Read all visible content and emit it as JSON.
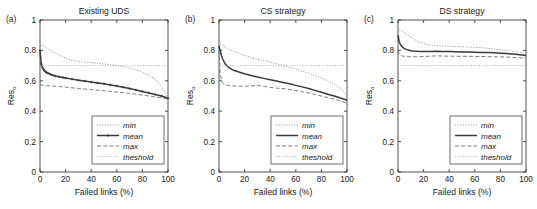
{
  "figure": {
    "xlabel": "Failed links (%)",
    "ylabel_main": "Res",
    "ylabel_sub": "o",
    "xticks": [
      "0",
      "20",
      "40",
      "60",
      "80",
      "100"
    ],
    "yticks": [
      "0",
      "0.2",
      "0.4",
      "0.6",
      "0.8",
      "1"
    ],
    "xlim": [
      0,
      100
    ],
    "ylim": [
      0,
      1
    ],
    "legend_items": [
      "min",
      "mean",
      "max",
      "theshold"
    ],
    "colors": {
      "min": "#8c8c8c",
      "mean": "#3a3a3a",
      "max": "#6e6e6e",
      "threshold": "#a8a8a8",
      "axis": "#3c3c3c",
      "background": "#ffffff"
    }
  },
  "panels": [
    {
      "letter": "(a)",
      "title": "Existing UDS"
    },
    {
      "letter": "(b)",
      "title": "CS strategy"
    },
    {
      "letter": "(c)",
      "title": "DS strategy"
    }
  ],
  "chart_data": [
    {
      "type": "line",
      "title": "Existing UDS",
      "panel": "(a)",
      "xlabel": "Failed links (%)",
      "ylabel": "Res_o",
      "xlim": [
        0,
        100
      ],
      "ylim": [
        0,
        1
      ],
      "grid": false,
      "legend_position": "lower right",
      "x": [
        0,
        1,
        2,
        3,
        4,
        5,
        6,
        8,
        10,
        12,
        15,
        18,
        20,
        25,
        30,
        35,
        40,
        45,
        50,
        55,
        60,
        65,
        70,
        75,
        80,
        85,
        90,
        95,
        100
      ],
      "series": [
        {
          "name": "min",
          "style": "dotted",
          "values": [
            0.82,
            0.835,
            0.835,
            0.83,
            0.825,
            0.818,
            0.81,
            0.8,
            0.79,
            0.782,
            0.77,
            0.757,
            0.75,
            0.735,
            0.727,
            0.724,
            0.72,
            0.715,
            0.71,
            0.706,
            0.7,
            0.693,
            0.684,
            0.672,
            0.657,
            0.636,
            0.61,
            0.565,
            0.49
          ]
        },
        {
          "name": "mean",
          "style": "solid-marker",
          "values": [
            0.8,
            0.71,
            0.685,
            0.672,
            0.663,
            0.656,
            0.651,
            0.643,
            0.637,
            0.632,
            0.626,
            0.621,
            0.618,
            0.611,
            0.604,
            0.598,
            0.592,
            0.586,
            0.58,
            0.573,
            0.566,
            0.558,
            0.549,
            0.54,
            0.53,
            0.52,
            0.51,
            0.5,
            0.485
          ]
        },
        {
          "name": "max",
          "style": "dashed",
          "values": [
            0.575,
            0.572,
            0.571,
            0.57,
            0.569,
            0.568,
            0.567,
            0.566,
            0.565,
            0.564,
            0.562,
            0.56,
            0.558,
            0.554,
            0.55,
            0.546,
            0.542,
            0.538,
            0.534,
            0.53,
            0.526,
            0.522,
            0.517,
            0.512,
            0.506,
            0.5,
            0.494,
            0.488,
            0.478
          ]
        },
        {
          "name": "theshold",
          "style": "dotted",
          "constant": 0.7,
          "values": [
            0.7,
            0.7,
            0.7,
            0.7,
            0.7,
            0.7,
            0.7,
            0.7,
            0.7,
            0.7,
            0.7,
            0.7,
            0.7,
            0.7,
            0.7,
            0.7,
            0.7,
            0.7,
            0.7,
            0.7,
            0.7,
            0.7,
            0.7,
            0.7,
            0.7,
            0.7,
            0.7,
            0.7,
            0.7
          ]
        }
      ]
    },
    {
      "type": "line",
      "title": "CS strategy",
      "panel": "(b)",
      "xlabel": "Failed links (%)",
      "ylabel": "Res_o",
      "xlim": [
        0,
        100
      ],
      "ylim": [
        0,
        1
      ],
      "grid": false,
      "legend_position": "lower right",
      "x": [
        0,
        1,
        2,
        3,
        4,
        5,
        6,
        8,
        10,
        12,
        15,
        18,
        20,
        25,
        30,
        35,
        40,
        45,
        50,
        55,
        60,
        65,
        70,
        75,
        80,
        85,
        90,
        95,
        100
      ],
      "series": [
        {
          "name": "min",
          "style": "dotted",
          "values": [
            0.82,
            0.84,
            0.838,
            0.832,
            0.826,
            0.82,
            0.815,
            0.806,
            0.8,
            0.793,
            0.783,
            0.772,
            0.767,
            0.752,
            0.742,
            0.733,
            0.724,
            0.712,
            0.7,
            0.688,
            0.676,
            0.664,
            0.65,
            0.634,
            0.617,
            0.6,
            0.578,
            0.549,
            0.5
          ]
        },
        {
          "name": "mean",
          "style": "solid",
          "values": [
            0.83,
            0.795,
            0.765,
            0.742,
            0.724,
            0.71,
            0.7,
            0.685,
            0.675,
            0.668,
            0.659,
            0.651,
            0.646,
            0.635,
            0.625,
            0.616,
            0.607,
            0.598,
            0.589,
            0.58,
            0.57,
            0.56,
            0.549,
            0.537,
            0.525,
            0.512,
            0.5,
            0.487,
            0.472
          ]
        },
        {
          "name": "max",
          "style": "dashed",
          "values": [
            0.8,
            0.64,
            0.6,
            0.585,
            0.578,
            0.574,
            0.572,
            0.569,
            0.567,
            0.566,
            0.565,
            0.564,
            0.564,
            0.566,
            0.57,
            0.563,
            0.556,
            0.552,
            0.549,
            0.543,
            0.536,
            0.528,
            0.52,
            0.51,
            0.5,
            0.49,
            0.479,
            0.467,
            0.452
          ]
        },
        {
          "name": "theshold",
          "style": "dotted",
          "constant": 0.7,
          "values": [
            0.7,
            0.7,
            0.7,
            0.7,
            0.7,
            0.7,
            0.7,
            0.7,
            0.7,
            0.7,
            0.7,
            0.7,
            0.7,
            0.7,
            0.7,
            0.7,
            0.7,
            0.7,
            0.7,
            0.7,
            0.7,
            0.7,
            0.7,
            0.7,
            0.7,
            0.7,
            0.7,
            0.7,
            0.7
          ]
        }
      ]
    },
    {
      "type": "line",
      "title": "DS strategy",
      "panel": "(c)",
      "xlabel": "Failed links (%)",
      "ylabel": "Res_o",
      "xlim": [
        0,
        100
      ],
      "ylim": [
        0,
        1
      ],
      "grid": false,
      "legend_position": "lower right",
      "x": [
        0,
        1,
        2,
        3,
        4,
        5,
        6,
        8,
        10,
        12,
        15,
        18,
        20,
        25,
        30,
        35,
        40,
        45,
        50,
        55,
        60,
        65,
        70,
        75,
        80,
        85,
        90,
        95,
        100
      ],
      "series": [
        {
          "name": "min",
          "style": "dotted",
          "values": [
            0.92,
            0.935,
            0.932,
            0.928,
            0.922,
            0.916,
            0.91,
            0.898,
            0.886,
            0.874,
            0.862,
            0.85,
            0.845,
            0.836,
            0.832,
            0.83,
            0.828,
            0.826,
            0.824,
            0.822,
            0.82,
            0.818,
            0.814,
            0.81,
            0.805,
            0.8,
            0.793,
            0.787,
            0.78
          ]
        },
        {
          "name": "mean",
          "style": "solid",
          "values": [
            0.9,
            0.855,
            0.838,
            0.826,
            0.818,
            0.812,
            0.808,
            0.802,
            0.798,
            0.796,
            0.794,
            0.793,
            0.793,
            0.793,
            0.794,
            0.793,
            0.792,
            0.791,
            0.79,
            0.789,
            0.788,
            0.787,
            0.786,
            0.784,
            0.782,
            0.78,
            0.776,
            0.772,
            0.767
          ]
        },
        {
          "name": "max",
          "style": "dashed",
          "values": [
            0.8,
            0.775,
            0.768,
            0.764,
            0.762,
            0.761,
            0.76,
            0.759,
            0.758,
            0.758,
            0.758,
            0.759,
            0.76,
            0.762,
            0.764,
            0.763,
            0.762,
            0.762,
            0.761,
            0.761,
            0.76,
            0.76,
            0.759,
            0.758,
            0.757,
            0.756,
            0.754,
            0.752,
            0.748
          ]
        },
        {
          "name": "theshold",
          "style": "dotted",
          "constant": 0.7,
          "values": [
            0.7,
            0.7,
            0.7,
            0.7,
            0.7,
            0.7,
            0.7,
            0.7,
            0.7,
            0.7,
            0.7,
            0.7,
            0.7,
            0.7,
            0.7,
            0.7,
            0.7,
            0.7,
            0.7,
            0.7,
            0.7,
            0.7,
            0.7,
            0.7,
            0.7,
            0.7,
            0.7,
            0.7,
            0.7
          ]
        }
      ]
    }
  ]
}
